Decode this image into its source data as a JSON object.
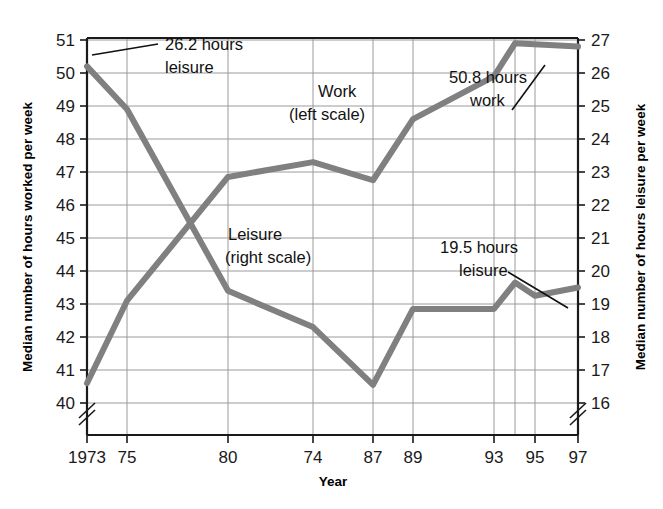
{
  "chart_data": {
    "type": "line",
    "title": "",
    "subtitle": "",
    "xlabel": "Year",
    "ylabel": "Median number of hours worked per week",
    "y2label": "Median number of hours leisure per week",
    "grid": true,
    "legend_position": "inline-annotations",
    "x": [
      "1973",
      "75",
      "80",
      "74",
      "87",
      "89",
      "93",
      "95",
      "97"
    ],
    "x_tick_labels": [
      "1973",
      "75",
      "80",
      "74",
      "87",
      "89",
      "93",
      "95",
      "97"
    ],
    "x_tick_positions": [
      87,
      127,
      228,
      313,
      373,
      413,
      494,
      535,
      578
    ],
    "ylim": [
      40,
      51
    ],
    "y_tick_labels": [
      "40",
      "41",
      "42",
      "43",
      "44",
      "45",
      "46",
      "47",
      "48",
      "49",
      "50",
      "51"
    ],
    "y2lim": [
      16,
      27
    ],
    "y2_tick_labels": [
      "16",
      "17",
      "18",
      "19",
      "20",
      "21",
      "22",
      "23",
      "24",
      "25",
      "26",
      "27"
    ],
    "axis_break_left": true,
    "axis_break_right": true,
    "line_color": "#808080",
    "series": [
      {
        "name": "Work (left scale)",
        "axis": "left",
        "points": [
          {
            "x": 87,
            "y": 40.6
          },
          {
            "x": 127,
            "y": 43.1
          },
          {
            "x": 228,
            "y": 46.85
          },
          {
            "x": 313,
            "y": 47.3
          },
          {
            "x": 373,
            "y": 46.75
          },
          {
            "x": 413,
            "y": 48.6
          },
          {
            "x": 494,
            "y": 49.9
          },
          {
            "x": 515,
            "y": 50.9
          },
          {
            "x": 578,
            "y": 50.8
          }
        ]
      },
      {
        "name": "Leisure (right scale)",
        "axis": "right",
        "points": [
          {
            "x": 87,
            "y": 26.2
          },
          {
            "x": 127,
            "y": 24.9
          },
          {
            "x": 228,
            "y": 19.4
          },
          {
            "x": 313,
            "y": 18.3
          },
          {
            "x": 373,
            "y": 16.55
          },
          {
            "x": 413,
            "y": 18.85
          },
          {
            "x": 494,
            "y": 18.85
          },
          {
            "x": 515,
            "y": 19.65
          },
          {
            "x": 535,
            "y": 19.25
          },
          {
            "x": 578,
            "y": 19.5
          }
        ]
      }
    ],
    "annotations": [
      {
        "id": "leisure-start",
        "text_line1": "26.2 hours",
        "text_line2": "leisure"
      },
      {
        "id": "work-end",
        "text_line1": "50.8 hours",
        "text_line2": "work"
      },
      {
        "id": "leisure-end",
        "text_line1": "19.5 hours",
        "text_line2": "leisure"
      },
      {
        "id": "work-series",
        "text_line1": "Work",
        "text_line2": "(left scale)"
      },
      {
        "id": "leisure-series",
        "text_line1": "Leisure",
        "text_line2": "(right scale)"
      }
    ]
  },
  "axes": {
    "left_title": "Median number of hours worked per week",
    "right_title": "Median number of hours leisure per week",
    "x_title": "Year"
  },
  "annotations": {
    "leisure_start_l1": "26.2 hours",
    "leisure_start_l2": "leisure",
    "work_end_l1": "50.8 hours",
    "work_end_l2": "work",
    "leisure_end_l1": "19.5 hours",
    "leisure_end_l2": "leisure",
    "work_series_l1": "Work",
    "work_series_l2": "(left scale)",
    "leisure_series_l1": "Leisure",
    "leisure_series_l2": "(right scale)"
  },
  "ticks": {
    "x": [
      "1973",
      "75",
      "80",
      "74",
      "87",
      "89",
      "93",
      "95",
      "97"
    ],
    "y_left": [
      "51",
      "50",
      "49",
      "48",
      "47",
      "46",
      "45",
      "44",
      "43",
      "42",
      "41",
      "40"
    ],
    "y_right": [
      "27",
      "26",
      "25",
      "24",
      "23",
      "22",
      "21",
      "20",
      "19",
      "18",
      "17",
      "16"
    ]
  },
  "colors": {
    "line": "#808080",
    "grid": "#9a9a9a",
    "axis": "#1a1a1a",
    "text": "#111111",
    "background": "#ffffff"
  }
}
